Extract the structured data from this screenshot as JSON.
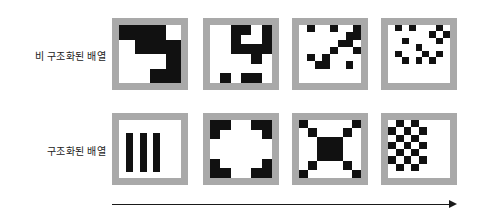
{
  "figure": {
    "title": "",
    "background_color": "#ffffff",
    "tile_border_color": "#a9a9a9",
    "cell_on_color": "#111111",
    "cell_off_color": "#ffffff",
    "arrow_color": "#1a1a1a"
  },
  "rows": [
    {
      "label": "비 구조화된 배열"
    },
    {
      "label": "구조화된 배열"
    }
  ],
  "axis": {
    "arrow_direction": "right",
    "arrow_label": ""
  },
  "chart_data": {
    "type": "heatmap",
    "title": "",
    "xlabel": "",
    "ylabel": "",
    "row_labels": [
      "비 구조화된 배열",
      "구조화된 배열"
    ],
    "tiles": [
      {
        "row": 0,
        "col": 0,
        "grid": 4,
        "matrix": [
          [
            1,
            1,
            1,
            0
          ],
          [
            0,
            1,
            1,
            1
          ],
          [
            0,
            0,
            0,
            1
          ],
          [
            0,
            0,
            1,
            1
          ]
        ]
      },
      {
        "row": 0,
        "col": 1,
        "grid": 6,
        "matrix": [
          [
            0,
            0,
            1,
            1,
            0,
            1
          ],
          [
            0,
            0,
            1,
            0,
            0,
            1
          ],
          [
            0,
            0,
            1,
            1,
            1,
            1
          ],
          [
            0,
            0,
            0,
            0,
            1,
            0
          ],
          [
            0,
            0,
            0,
            0,
            0,
            0
          ],
          [
            0,
            1,
            0,
            1,
            1,
            0
          ]
        ]
      },
      {
        "row": 0,
        "col": 2,
        "grid": 8,
        "matrix": [
          [
            0,
            1,
            0,
            0,
            1,
            0,
            0,
            1
          ],
          [
            0,
            0,
            0,
            0,
            0,
            0,
            1,
            1
          ],
          [
            0,
            0,
            0,
            0,
            0,
            1,
            1,
            0
          ],
          [
            0,
            0,
            0,
            0,
            1,
            0,
            0,
            1
          ],
          [
            0,
            1,
            0,
            1,
            0,
            0,
            0,
            0
          ],
          [
            0,
            0,
            1,
            1,
            0,
            0,
            1,
            0
          ],
          [
            0,
            0,
            0,
            0,
            0,
            0,
            0,
            0
          ],
          [
            0,
            0,
            0,
            0,
            0,
            0,
            0,
            0
          ]
        ]
      },
      {
        "row": 0,
        "col": 3,
        "grid": 9,
        "matrix": [
          [
            0,
            1,
            0,
            1,
            0,
            0,
            0,
            1,
            0
          ],
          [
            0,
            0,
            0,
            0,
            0,
            0,
            1,
            0,
            1
          ],
          [
            0,
            0,
            1,
            0,
            0,
            0,
            0,
            1,
            0
          ],
          [
            0,
            0,
            0,
            0,
            1,
            0,
            0,
            0,
            0
          ],
          [
            0,
            1,
            0,
            0,
            0,
            1,
            0,
            1,
            0
          ],
          [
            0,
            0,
            1,
            0,
            1,
            0,
            1,
            0,
            0
          ],
          [
            0,
            0,
            0,
            0,
            0,
            0,
            0,
            0,
            0
          ],
          [
            0,
            0,
            0,
            0,
            0,
            0,
            0,
            0,
            0
          ],
          [
            0,
            0,
            0,
            0,
            0,
            0,
            0,
            0,
            0
          ]
        ]
      },
      {
        "row": 1,
        "col": 0,
        "grid": 9,
        "pattern": "vertical-stripes",
        "matrix": [
          [
            0,
            0,
            0,
            0,
            0,
            0,
            0,
            0,
            0
          ],
          [
            0,
            0,
            0,
            0,
            0,
            0,
            0,
            0,
            0
          ],
          [
            0,
            1,
            0,
            1,
            0,
            1,
            0,
            0,
            0
          ],
          [
            0,
            1,
            0,
            1,
            0,
            1,
            0,
            0,
            0
          ],
          [
            0,
            1,
            0,
            1,
            0,
            1,
            0,
            0,
            0
          ],
          [
            0,
            1,
            0,
            1,
            0,
            1,
            0,
            0,
            0
          ],
          [
            0,
            1,
            0,
            1,
            0,
            1,
            0,
            0,
            0
          ],
          [
            0,
            1,
            0,
            1,
            0,
            1,
            0,
            0,
            0
          ],
          [
            0,
            0,
            0,
            0,
            0,
            0,
            0,
            0,
            0
          ]
        ]
      },
      {
        "row": 1,
        "col": 1,
        "grid": 6,
        "pattern": "four-corners",
        "matrix": [
          [
            1,
            1,
            0,
            0,
            1,
            1
          ],
          [
            1,
            0,
            0,
            0,
            0,
            1
          ],
          [
            0,
            0,
            0,
            0,
            0,
            0
          ],
          [
            0,
            0,
            0,
            0,
            0,
            0
          ],
          [
            1,
            0,
            0,
            0,
            0,
            1
          ],
          [
            1,
            1,
            0,
            0,
            1,
            1
          ]
        ]
      },
      {
        "row": 1,
        "col": 2,
        "grid": 7,
        "pattern": "diagonal-cross",
        "matrix": [
          [
            1,
            0,
            0,
            0,
            0,
            0,
            1
          ],
          [
            0,
            1,
            0,
            0,
            0,
            1,
            0
          ],
          [
            0,
            0,
            1,
            1,
            1,
            0,
            0
          ],
          [
            0,
            0,
            1,
            1,
            1,
            0,
            0
          ],
          [
            0,
            0,
            1,
            1,
            1,
            0,
            0
          ],
          [
            0,
            1,
            0,
            0,
            0,
            1,
            0
          ],
          [
            1,
            0,
            0,
            0,
            0,
            0,
            1
          ]
        ]
      },
      {
        "row": 1,
        "col": 3,
        "grid": 8,
        "pattern": "checkerboard",
        "matrix": [
          [
            0,
            1,
            0,
            1,
            0,
            0,
            0,
            0
          ],
          [
            1,
            0,
            1,
            0,
            1,
            0,
            0,
            0
          ],
          [
            0,
            1,
            0,
            1,
            0,
            0,
            0,
            0
          ],
          [
            1,
            0,
            1,
            0,
            1,
            0,
            0,
            0
          ],
          [
            0,
            1,
            0,
            1,
            0,
            0,
            0,
            0
          ],
          [
            1,
            0,
            1,
            0,
            1,
            0,
            0,
            0
          ],
          [
            0,
            1,
            0,
            1,
            0,
            0,
            0,
            0
          ],
          [
            0,
            0,
            0,
            0,
            0,
            0,
            0,
            0
          ]
        ]
      }
    ]
  }
}
